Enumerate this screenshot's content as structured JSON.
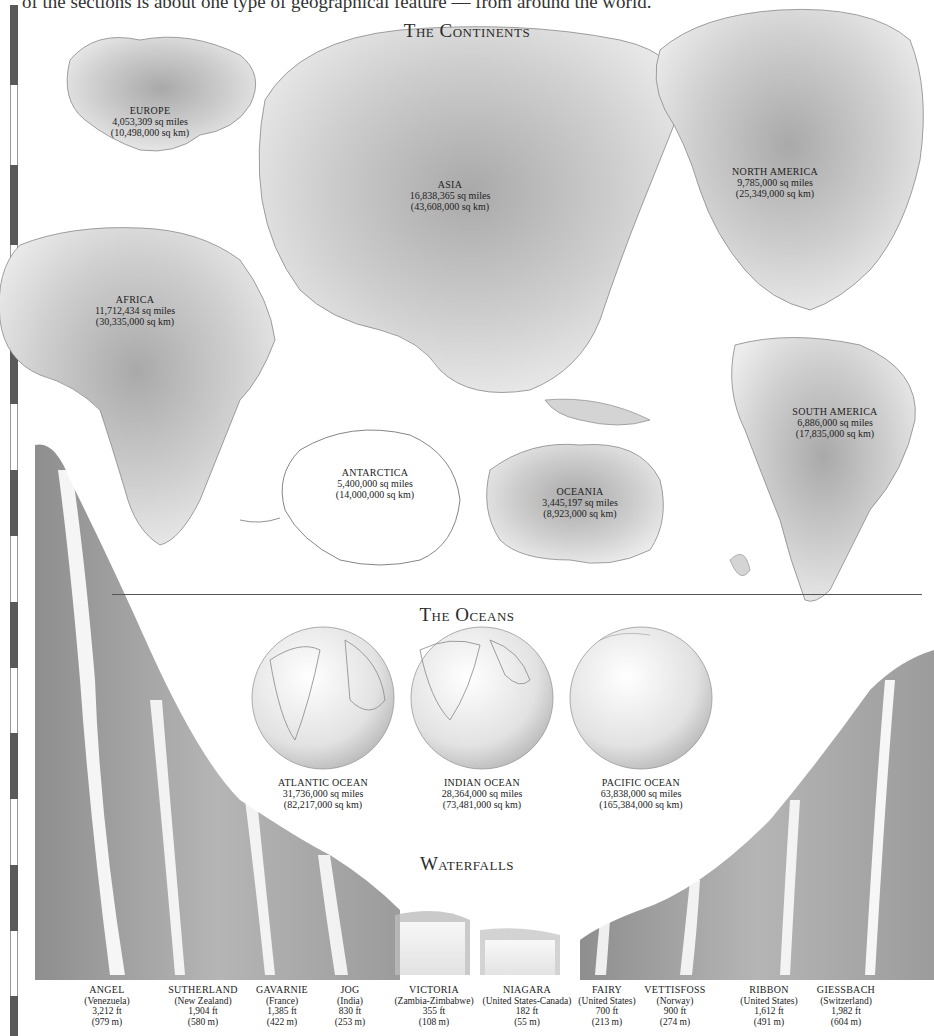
{
  "intro_text": "of the sections is about one type of geographical feature — from around the world.",
  "sections": {
    "continents": {
      "title": "The Continents"
    },
    "oceans": {
      "title": "The Oceans"
    },
    "waterfalls": {
      "title": "Waterfalls"
    }
  },
  "continents": [
    {
      "name": "EUROPE",
      "area_mi": "4,053,309 sq miles",
      "area_km": "(10,498,000 sq km)"
    },
    {
      "name": "ASIA",
      "area_mi": "16,838,365 sq miles",
      "area_km": "(43,608,000 sq km)"
    },
    {
      "name": "NORTH AMERICA",
      "area_mi": "9,785,000 sq miles",
      "area_km": "(25,349,000 sq km)"
    },
    {
      "name": "AFRICA",
      "area_mi": "11,712,434 sq miles",
      "area_km": "(30,335,000 sq km)"
    },
    {
      "name": "SOUTH AMERICA",
      "area_mi": "6,886,000 sq miles",
      "area_km": "(17,835,000 sq km)"
    },
    {
      "name": "ANTARCTICA",
      "area_mi": "5,400,000 sq miles",
      "area_km": "(14,000,000 sq km)"
    },
    {
      "name": "OCEANIA",
      "area_mi": "3,445,197 sq miles",
      "area_km": "(8,923,000 sq km)"
    }
  ],
  "oceans": [
    {
      "name": "ATLANTIC OCEAN",
      "area_mi": "31,736,000 sq miles",
      "area_km": "(82,217,000 sq km)"
    },
    {
      "name": "INDIAN OCEAN",
      "area_mi": "28,364,000 sq miles",
      "area_km": "(73,481,000 sq km)"
    },
    {
      "name": "PACIFIC OCEAN",
      "area_mi": "63,838,000 sq miles",
      "area_km": "(165,384,000 sq km)"
    }
  ],
  "waterfalls": [
    {
      "name": "ANGEL",
      "country": "(Venezuela)",
      "height_ft": "3,212 ft",
      "height_m": "(979 m)"
    },
    {
      "name": "SUTHERLAND",
      "country": "(New Zealand)",
      "height_ft": "1,904 ft",
      "height_m": "(580 m)"
    },
    {
      "name": "GAVARNIE",
      "country": "(France)",
      "height_ft": "1,385 ft",
      "height_m": "(422 m)"
    },
    {
      "name": "JOG",
      "country": "(India)",
      "height_ft": "830 ft",
      "height_m": "(253 m)"
    },
    {
      "name": "VICTORIA",
      "country": "(Zambia-Zimbabwe)",
      "height_ft": "355 ft",
      "height_m": "(108 m)"
    },
    {
      "name": "NIAGARA",
      "country": "(United States-Canada)",
      "height_ft": "182 ft",
      "height_m": "(55 m)"
    },
    {
      "name": "FAIRY",
      "country": "(United States)",
      "height_ft": "700 ft",
      "height_m": "(213 m)"
    },
    {
      "name": "VETTISFOSS",
      "country": "(Norway)",
      "height_ft": "900 ft",
      "height_m": "(274 m)"
    },
    {
      "name": "RIBBON",
      "country": "(United States)",
      "height_ft": "1,612 ft",
      "height_m": "(491 m)"
    },
    {
      "name": "GIESSBACH",
      "country": "(Switzerland)",
      "height_ft": "1,982 ft",
      "height_m": "(604 m)"
    }
  ]
}
